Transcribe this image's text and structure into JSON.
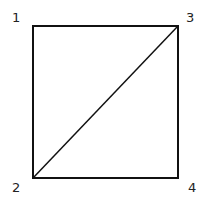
{
  "diagram": {
    "shape": "square-with-diagonal",
    "stroke_color": "#111111",
    "vertices": [
      {
        "label": "1",
        "position": "top-left"
      },
      {
        "label": "2",
        "position": "bottom-left"
      },
      {
        "label": "3",
        "position": "top-right"
      },
      {
        "label": "4",
        "position": "bottom-right"
      }
    ],
    "diagonal": {
      "from": "2",
      "to": "3"
    }
  }
}
